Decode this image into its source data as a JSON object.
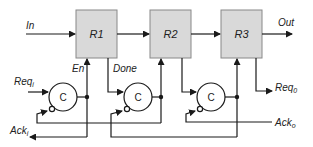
{
  "diagram": {
    "type": "micropipeline",
    "colors": {
      "box_fill": "#d9d9d9",
      "line": "#1a1a1a",
      "background": "#ffffff"
    },
    "registers": [
      {
        "id": "R1",
        "label": "R1"
      },
      {
        "id": "R2",
        "label": "R2"
      },
      {
        "id": "R3",
        "label": "R3"
      }
    ],
    "c_elements": [
      {
        "id": "C1",
        "label": "C"
      },
      {
        "id": "C2",
        "label": "C"
      },
      {
        "id": "C3",
        "label": "C"
      }
    ],
    "signals": {
      "in": "In",
      "out": "Out",
      "en": "En",
      "done": "Done",
      "req_i_main": "Req",
      "req_i_sub": "i",
      "ack_i_main": "Ack",
      "ack_i_sub": "i",
      "req_o_main": "Req",
      "req_o_sub": "0",
      "ack_o_main": "Ack",
      "ack_o_sub": "o"
    }
  }
}
